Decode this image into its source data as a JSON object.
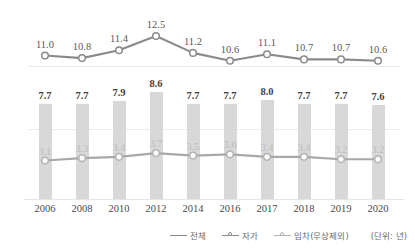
{
  "chart_data": {
    "type": "line",
    "title": "",
    "subtitle": "",
    "xlabel": "",
    "ylabel": "",
    "unit_note": "(단위: 년)",
    "grid": true,
    "legend_position": "bottom-right",
    "categories": [
      "2006",
      "2008",
      "2010",
      "2012",
      "2014",
      "2016",
      "2017",
      "2018",
      "2019",
      "2020"
    ],
    "series": [
      {
        "name": "전체",
        "kind": "line",
        "values": [
          11.0,
          10.8,
          11.4,
          12.5,
          11.2,
          10.6,
          11.1,
          10.7,
          10.7,
          10.6
        ],
        "labels": [
          "11.0",
          "10.8",
          "11.4",
          "12.5",
          "11.2",
          "10.6",
          "11.1",
          "10.7",
          "10.7",
          "10.6"
        ],
        "ylim": [
          10.0,
          13.0
        ],
        "color": "#8a8a8a"
      },
      {
        "name": "자가",
        "kind": "bar",
        "values": [
          7.7,
          7.7,
          7.9,
          8.6,
          7.7,
          7.7,
          8.0,
          7.7,
          7.7,
          7.6
        ],
        "labels": [
          "7.7",
          "7.7",
          "7.9",
          "8.6",
          "7.7",
          "7.7",
          "8.0",
          "7.7",
          "7.7",
          "7.6"
        ],
        "ylim": [
          0,
          9.0
        ],
        "color": "#d8d8d8"
      },
      {
        "name": "임차(무상제외)",
        "kind": "line",
        "values": [
          3.1,
          3.3,
          3.4,
          3.7,
          3.5,
          3.6,
          3.4,
          3.4,
          3.2,
          3.2
        ],
        "labels": [
          "3.1",
          "3.3",
          "3.4",
          "3.7",
          "3.5",
          "3.6",
          "3.4",
          "3.4",
          "3.2",
          "3.2"
        ],
        "ylim": [
          0,
          9.0
        ],
        "color": "#b4b4b4"
      }
    ]
  },
  "legend": {
    "items": [
      {
        "label": "전체",
        "glyph": "line-icon"
      },
      {
        "label": "자가",
        "glyph": "line-marker-icon"
      },
      {
        "label": "임차(무상제외)",
        "glyph": "line-marker-faint-icon"
      }
    ]
  }
}
